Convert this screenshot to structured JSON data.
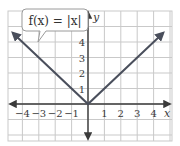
{
  "chart_data": {
    "type": "line",
    "title": "",
    "annotation": "f(x) = |x|",
    "xlabel": "x",
    "ylabel": "y",
    "xlim": [
      -5,
      5
    ],
    "ylim": [
      -2.4,
      6
    ],
    "grid": true,
    "x_ticks": [
      -4,
      -3,
      -2,
      -1,
      1,
      2,
      3,
      4
    ],
    "y_ticks": [
      1,
      2,
      3,
      4
    ],
    "x_tick_labels": [
      "−4",
      "−3",
      "−2",
      "−1",
      "1",
      "2",
      "3",
      "4"
    ],
    "y_tick_labels": [
      "1",
      "2",
      "3",
      "4"
    ],
    "series": [
      {
        "name": "f(x) = |x|",
        "x": [
          -5,
          0,
          5
        ],
        "y": [
          5,
          0,
          5
        ]
      }
    ]
  },
  "colors": {
    "curve": "#4a4f5c",
    "axis": "#3a3a3a",
    "grid": "#c9c9c9"
  }
}
